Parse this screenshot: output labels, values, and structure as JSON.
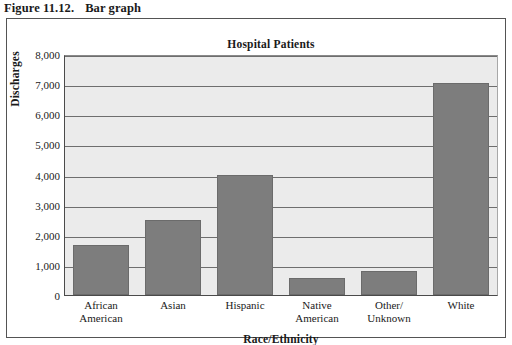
{
  "figure": {
    "caption_number": "Figure 11.12.",
    "caption_text": "Bar graph"
  },
  "chart_data": {
    "type": "bar",
    "title": "Hospital Patients",
    "xlabel": "Race/Ethnicity",
    "ylabel": "Discharges",
    "categories": [
      "African American",
      "Asian",
      "Hispanic",
      "Native American",
      "Other/ Unknown",
      "White"
    ],
    "category_lines": [
      [
        "African",
        "American"
      ],
      [
        "Asian"
      ],
      [
        "Hispanic"
      ],
      [
        "Native",
        "American"
      ],
      [
        "Other/",
        "Unknown"
      ],
      [
        "White"
      ]
    ],
    "values": [
      1650,
      2500,
      3980,
      550,
      800,
      7050
    ],
    "ylim": [
      0,
      8000
    ],
    "ytick_values": [
      0,
      1000,
      2000,
      3000,
      4000,
      5000,
      6000,
      7000,
      8000
    ],
    "ytick_labels": [
      "0",
      "1,000",
      "2,000",
      "3,000",
      "4,000",
      "5,000",
      "6,000",
      "7,000",
      "8,000"
    ],
    "grid": true,
    "legend": "none",
    "bar_color": "#7d7d7d",
    "plot_background": "#ebebeb"
  }
}
